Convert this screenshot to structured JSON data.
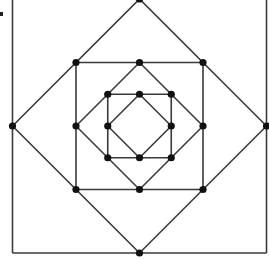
{
  "diagram": {
    "levels": 3,
    "line_color": "#3a3a3a",
    "dot_color": "#111111",
    "background": "#ffffff"
  }
}
